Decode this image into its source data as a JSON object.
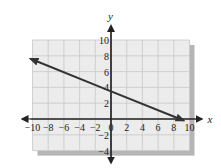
{
  "chart_data": {
    "type": "line",
    "title": "",
    "xlabel": "x",
    "ylabel": "y",
    "xlim": [
      -10,
      10
    ],
    "ylim": [
      -4,
      10
    ],
    "grid": true,
    "x_ticks": [
      -10,
      -8,
      -6,
      -4,
      -2,
      0,
      2,
      4,
      6,
      8,
      10
    ],
    "x_tick_labels": [
      "-10",
      "-8",
      "-6",
      "-4",
      "-2",
      "0",
      "2",
      "4",
      "6",
      "8",
      "10"
    ],
    "y_ticks": [
      -4,
      -2,
      2,
      4,
      6,
      8,
      10
    ],
    "y_tick_labels": [
      "-4",
      "-2",
      "2",
      "4",
      "6",
      "8",
      "10"
    ],
    "series": [
      {
        "name": "line",
        "x": [
          -10,
          0,
          8.75
        ],
        "y": [
          7.5,
          3.5,
          0
        ],
        "arrows": "both",
        "color": "#333333"
      }
    ],
    "colors": {
      "grid_background": "#ececec",
      "grid_lines": "#ffffff",
      "shadow": "#b5b5b5",
      "axis": "#222222"
    }
  }
}
